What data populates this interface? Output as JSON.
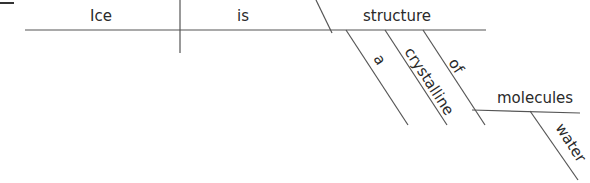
{
  "diagram": {
    "type": "sentence-diagram",
    "sentence": "Ice is a crystalline structure of water molecules",
    "line_color": "#555555",
    "text_color": "#2a2a2a",
    "subject": "Ice",
    "verb": "is",
    "predicate_nominative": "structure",
    "modifiers": [
      {
        "word": "a",
        "modifies": "structure"
      },
      {
        "word": "crystalline",
        "modifies": "structure"
      }
    ],
    "preposition": {
      "word": "of",
      "object": "molecules",
      "object_modifier": "water"
    }
  }
}
